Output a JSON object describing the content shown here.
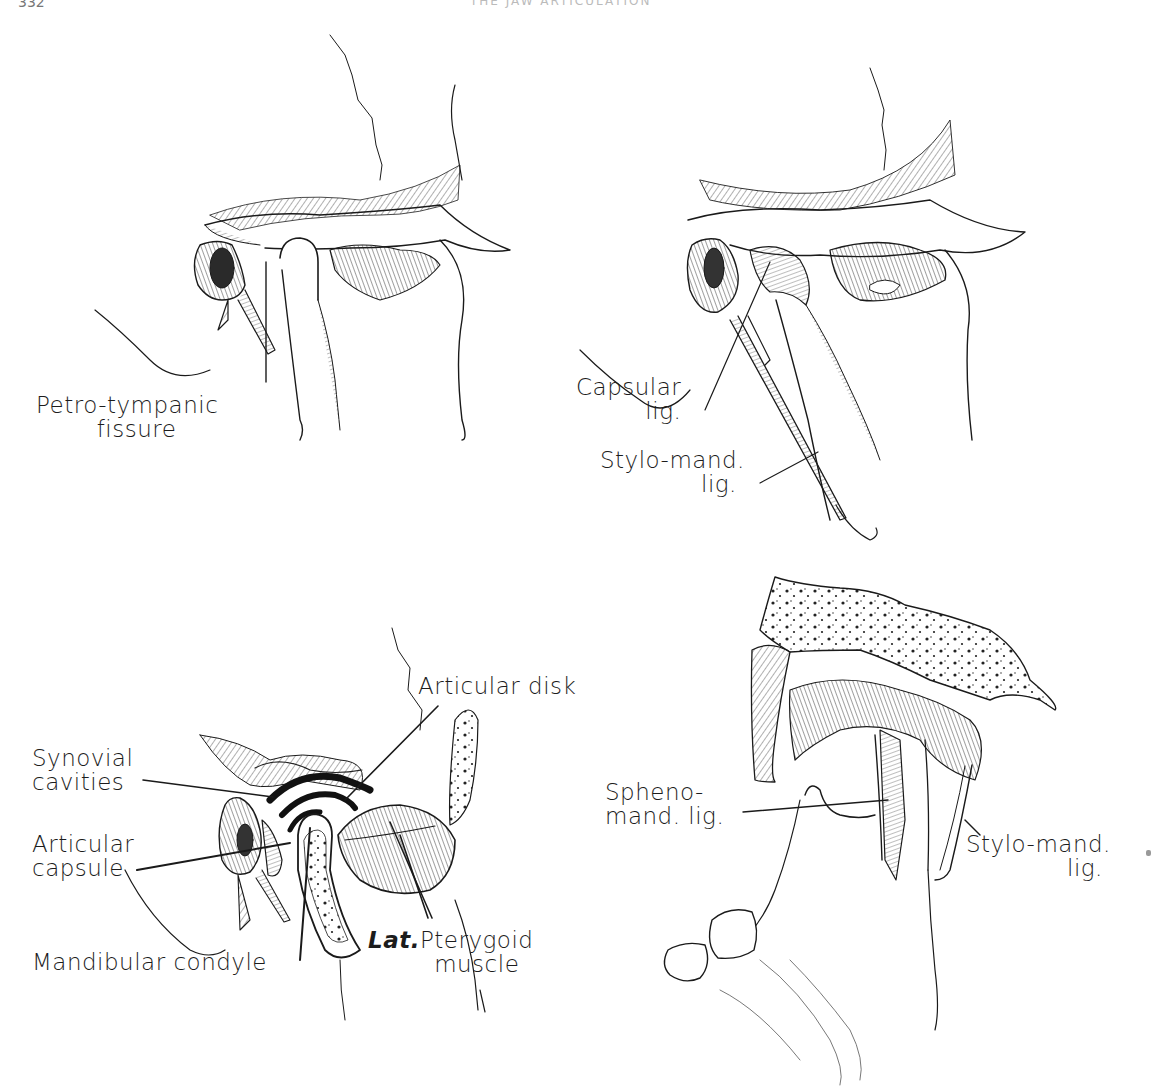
{
  "page": {
    "header_fragment": "332",
    "running_head": "THE JAW ARTICULATION"
  },
  "figures": [
    {
      "id": "fig-top-left",
      "description": "Lateral view of temporomandibular joint, condyle in glenoid fossa",
      "labels": [
        {
          "key": "petro_tympanic",
          "lines": [
            "Petro-tympanic",
            "fissure"
          ]
        }
      ]
    },
    {
      "id": "fig-top-right",
      "description": "Lateral view of TMJ showing capsular and stylomandibular ligaments",
      "labels": [
        {
          "key": "capsular_lig",
          "lines": [
            "Capsular",
            "lig."
          ]
        },
        {
          "key": "stylo_mand_lig",
          "lines": [
            "Stylo-mand.",
            "lig."
          ]
        }
      ]
    },
    {
      "id": "fig-bottom-left",
      "description": "Sagittal section of TMJ showing disk, synovial cavities and condyle",
      "labels": [
        {
          "key": "articular_disk",
          "lines": [
            "Articular disk"
          ]
        },
        {
          "key": "synovial_cavities",
          "lines": [
            "Synovial",
            "cavities"
          ]
        },
        {
          "key": "articular_capsule",
          "lines": [
            "Articular",
            "capsule"
          ]
        },
        {
          "key": "mandibular_condyle",
          "lines": [
            "Mandibular condyle"
          ]
        },
        {
          "key": "lat_pterygoid",
          "lines": [
            "Lat.",
            "Pterygoid",
            "muscle"
          ]
        }
      ]
    },
    {
      "id": "fig-bottom-right",
      "description": "Medial view of TMJ showing sphenomandibular and stylomandibular ligaments",
      "labels": [
        {
          "key": "spheno_mand_lig",
          "lines": [
            "Spheno-",
            "mand. lig."
          ]
        },
        {
          "key": "stylo_mand_lig_medial",
          "lines": [
            "Stylo-mand.",
            "lig."
          ]
        }
      ]
    }
  ],
  "labels": {
    "petro_tympanic": {
      "l1": "Petro-tympanic",
      "l2": "fissure"
    },
    "capsular_lig": {
      "l1": "Capsular",
      "l2": "lig."
    },
    "stylo_mand_lig": {
      "l1": "Stylo-mand.",
      "l2": "lig."
    },
    "articular_disk": {
      "l1": "Articular disk"
    },
    "synovial_cavities": {
      "l1": "Synovial",
      "l2": "cavities"
    },
    "articular_capsule": {
      "l1": "Articular",
      "l2": "capsule"
    },
    "mandibular_condyle": {
      "l1": "Mandibular condyle"
    },
    "lat_pterygoid": {
      "prefix": "Lat.",
      "l1": "Pterygoid",
      "l2": "muscle"
    },
    "spheno_mand_lig": {
      "l1": "Spheno-",
      "l2": "mand. lig."
    },
    "stylo_mand_lig_medial": {
      "l1": "Stylo-mand.",
      "l2": "lig."
    }
  },
  "colors": {
    "ink": "#1a1a1a",
    "paper": "#ffffff",
    "hatch": "#3a3a3a"
  }
}
